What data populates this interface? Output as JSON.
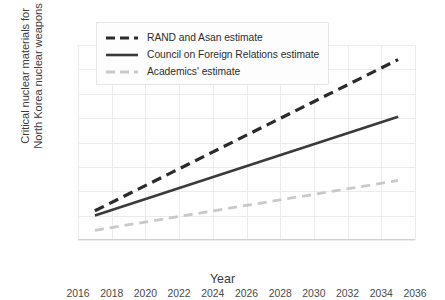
{
  "chart_data": {
    "type": "line",
    "title": "",
    "xlabel": "Year",
    "ylabel": "Critical nuclear materials for\nNorth Korea nuclear weapons",
    "xlim": [
      2016,
      2036
    ],
    "ylim": [
      0,
      400
    ],
    "xticks": [
      2016,
      2018,
      2020,
      2022,
      2024,
      2026,
      2028,
      2030,
      2032,
      2034,
      2036
    ],
    "yticks": [
      0,
      50,
      100,
      150,
      200,
      250,
      300,
      350,
      400
    ],
    "grid": true,
    "legend_position": "upper-left",
    "series": [
      {
        "name": "RAND and Asan estimate",
        "style": "dashed",
        "color": "#2b2b2b",
        "width": 3.2,
        "x": [
          2017,
          2035
        ],
        "values": [
          60,
          370
        ]
      },
      {
        "name": "Council on Foreign Relations estimate",
        "style": "solid",
        "color": "#3a3a3a",
        "width": 2.6,
        "x": [
          2017,
          2035
        ],
        "values": [
          50,
          253
        ]
      },
      {
        "name": "Academics' estimate",
        "style": "dashed",
        "color": "#c9c9c9",
        "width": 2.8,
        "x": [
          2017,
          2035
        ],
        "values": [
          20,
          122
        ]
      }
    ]
  },
  "axes": {
    "x_title": "Year",
    "y_title": "Critical nuclear materials for\nNorth Korea nuclear weapons",
    "x_tick_labels": [
      "2016",
      "2018",
      "2020",
      "2022",
      "2024",
      "2026",
      "2028",
      "2030",
      "2032",
      "2034",
      "2036"
    ],
    "y_tick_labels": [
      "0",
      "50",
      "100",
      "150",
      "200",
      "250",
      "300",
      "350",
      "400"
    ]
  },
  "legend": {
    "entries": [
      {
        "label": "RAND and Asan estimate"
      },
      {
        "label": "Council on Foreign Relations estimate"
      },
      {
        "label": "Academics' estimate"
      }
    ]
  },
  "colors": {
    "series_dark": "#2b2b2b",
    "series_mid": "#3a3a3a",
    "series_light": "#c9c9c9",
    "grid": "#ececec",
    "text": "#3b3b3b",
    "background": "#ffffff"
  }
}
